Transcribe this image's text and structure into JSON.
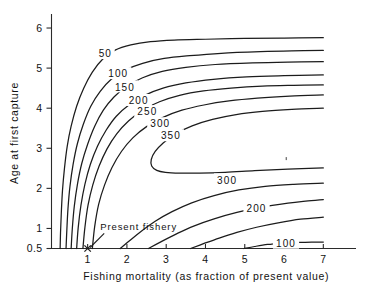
{
  "chart_data": {
    "type": "line",
    "subtype": "contour",
    "title": "",
    "xlabel": "Fishing mortality (as fraction of present value)",
    "ylabel": "Age at first capture",
    "xlim": [
      0.08,
      7.45
    ],
    "ylim": [
      0.5,
      6.25
    ],
    "grid": false,
    "legend": "none",
    "xticks": [
      1,
      2,
      3,
      4,
      5,
      6,
      7
    ],
    "xticklabels": [
      "1",
      "2",
      "3",
      "4",
      "5",
      "6",
      "7"
    ],
    "yticks": [
      0.5,
      1,
      2,
      3,
      4,
      5,
      6
    ],
    "yticklabels": [
      "0.5",
      "1",
      "2",
      "3",
      "4",
      "5",
      "6"
    ],
    "contour_levels": [
      50,
      100,
      150,
      200,
      250,
      300,
      350
    ],
    "zlabel": "Yield",
    "annotations": [
      {
        "text": "Present fishery",
        "x": 1.0,
        "y": 0.5,
        "label_x": 1.32,
        "label_y": 0.95,
        "marker": "x"
      }
    ],
    "contour_labels": [
      {
        "level": "50",
        "x": 1.45,
        "y": 5.35
      },
      {
        "level": "100",
        "x": 1.78,
        "y": 4.85
      },
      {
        "level": "150",
        "x": 1.95,
        "y": 4.52
      },
      {
        "level": "200",
        "x": 2.3,
        "y": 4.18
      },
      {
        "level": "250",
        "x": 2.52,
        "y": 3.9
      },
      {
        "level": "300",
        "x": 2.85,
        "y": 3.6
      },
      {
        "level": "350",
        "x": 3.12,
        "y": 3.3
      },
      {
        "level": "300",
        "x": 4.55,
        "y": 2.2
      },
      {
        "level": "200",
        "x": 5.3,
        "y": 1.5
      },
      {
        "level": "100",
        "x": 6.05,
        "y": 0.62
      }
    ],
    "contours": [
      {
        "level": 50,
        "branch": "upper",
        "points": [
          [
            0.3,
            0.5
          ],
          [
            0.31,
            0.9
          ],
          [
            0.33,
            1.4
          ],
          [
            0.36,
            1.95
          ],
          [
            0.41,
            2.5
          ],
          [
            0.48,
            3.05
          ],
          [
            0.58,
            3.55
          ],
          [
            0.72,
            4.05
          ],
          [
            0.9,
            4.5
          ],
          [
            1.12,
            4.9
          ],
          [
            1.38,
            5.22
          ],
          [
            1.7,
            5.45
          ],
          [
            2.1,
            5.58
          ],
          [
            2.6,
            5.66
          ],
          [
            3.2,
            5.7
          ],
          [
            4.0,
            5.72
          ],
          [
            5.0,
            5.74
          ],
          [
            6.0,
            5.75
          ],
          [
            7.0,
            5.76
          ]
        ]
      },
      {
        "level": 100,
        "branch": "upper",
        "points": [
          [
            0.45,
            0.5
          ],
          [
            0.47,
            0.95
          ],
          [
            0.5,
            1.5
          ],
          [
            0.55,
            2.05
          ],
          [
            0.63,
            2.6
          ],
          [
            0.74,
            3.12
          ],
          [
            0.89,
            3.6
          ],
          [
            1.08,
            4.05
          ],
          [
            1.32,
            4.42
          ],
          [
            1.6,
            4.72
          ],
          [
            1.95,
            4.95
          ],
          [
            2.4,
            5.12
          ],
          [
            2.95,
            5.24
          ],
          [
            3.6,
            5.31
          ],
          [
            4.4,
            5.37
          ],
          [
            5.4,
            5.41
          ],
          [
            6.2,
            5.43
          ],
          [
            7.0,
            5.44
          ]
        ]
      },
      {
        "level": 150,
        "branch": "upper",
        "points": [
          [
            0.58,
            0.5
          ],
          [
            0.61,
            1.0
          ],
          [
            0.66,
            1.55
          ],
          [
            0.74,
            2.1
          ],
          [
            0.85,
            2.62
          ],
          [
            1.0,
            3.1
          ],
          [
            1.18,
            3.55
          ],
          [
            1.4,
            3.95
          ],
          [
            1.67,
            4.28
          ],
          [
            2.0,
            4.55
          ],
          [
            2.4,
            4.76
          ],
          [
            2.9,
            4.92
          ],
          [
            3.5,
            5.02
          ],
          [
            4.25,
            5.09
          ],
          [
            5.2,
            5.13
          ],
          [
            6.1,
            5.15
          ],
          [
            7.0,
            5.16
          ]
        ]
      },
      {
        "level": 200,
        "branch": "upper",
        "points": [
          [
            0.72,
            0.5
          ],
          [
            0.76,
            1.02
          ],
          [
            0.83,
            1.58
          ],
          [
            0.93,
            2.1
          ],
          [
            1.07,
            2.6
          ],
          [
            1.25,
            3.05
          ],
          [
            1.47,
            3.45
          ],
          [
            1.73,
            3.8
          ],
          [
            2.05,
            4.08
          ],
          [
            2.45,
            4.32
          ],
          [
            2.92,
            4.5
          ],
          [
            3.5,
            4.63
          ],
          [
            4.2,
            4.72
          ],
          [
            5.05,
            4.78
          ],
          [
            6.0,
            4.81
          ],
          [
            7.0,
            4.83
          ]
        ]
      },
      {
        "level": 250,
        "branch": "upper",
        "points": [
          [
            0.88,
            0.5
          ],
          [
            0.93,
            1.02
          ],
          [
            1.01,
            1.58
          ],
          [
            1.13,
            2.08
          ],
          [
            1.29,
            2.55
          ],
          [
            1.49,
            2.98
          ],
          [
            1.74,
            3.36
          ],
          [
            2.04,
            3.68
          ],
          [
            2.4,
            3.95
          ],
          [
            2.83,
            4.16
          ],
          [
            3.34,
            4.32
          ],
          [
            3.95,
            4.43
          ],
          [
            4.65,
            4.5
          ],
          [
            5.45,
            4.55
          ],
          [
            6.25,
            4.57
          ],
          [
            7.0,
            4.58
          ]
        ]
      },
      {
        "level": 300,
        "branch": "upper",
        "points": [
          [
            1.12,
            0.5
          ],
          [
            1.18,
            1.05
          ],
          [
            1.28,
            1.6
          ],
          [
            1.43,
            2.08
          ],
          [
            1.62,
            2.52
          ],
          [
            1.86,
            2.92
          ],
          [
            2.15,
            3.26
          ],
          [
            2.5,
            3.54
          ],
          [
            2.92,
            3.77
          ],
          [
            3.4,
            3.95
          ],
          [
            3.96,
            4.08
          ],
          [
            4.6,
            4.18
          ],
          [
            5.32,
            4.25
          ],
          [
            6.15,
            4.3
          ],
          [
            7.0,
            4.33
          ]
        ]
      },
      {
        "level": 350,
        "branch": "closed",
        "points": [
          [
            7.0,
            4.0
          ],
          [
            6.2,
            3.97
          ],
          [
            5.45,
            3.92
          ],
          [
            4.78,
            3.84
          ],
          [
            4.18,
            3.72
          ],
          [
            3.66,
            3.56
          ],
          [
            3.24,
            3.36
          ],
          [
            2.93,
            3.14
          ],
          [
            2.72,
            2.92
          ],
          [
            2.62,
            2.72
          ],
          [
            2.63,
            2.56
          ],
          [
            2.76,
            2.45
          ],
          [
            2.98,
            2.4
          ],
          [
            3.35,
            2.38
          ],
          [
            3.85,
            2.38
          ],
          [
            4.5,
            2.4
          ],
          [
            5.25,
            2.44
          ],
          [
            6.1,
            2.48
          ],
          [
            7.0,
            2.51
          ]
        ]
      },
      {
        "level": 300,
        "branch": "lower",
        "points": [
          [
            1.83,
            0.5
          ],
          [
            2.05,
            0.68
          ],
          [
            2.35,
            0.92
          ],
          [
            2.72,
            1.18
          ],
          [
            3.15,
            1.42
          ],
          [
            3.65,
            1.64
          ],
          [
            4.22,
            1.82
          ],
          [
            4.85,
            1.96
          ],
          [
            5.52,
            2.05
          ],
          [
            6.25,
            2.1
          ],
          [
            7.0,
            2.13
          ]
        ]
      },
      {
        "level": 250,
        "branch": "lower",
        "points": [
          [
            2.55,
            0.5
          ],
          [
            2.85,
            0.66
          ],
          [
            3.25,
            0.86
          ],
          [
            3.7,
            1.06
          ],
          [
            4.22,
            1.24
          ],
          [
            4.8,
            1.4
          ],
          [
            5.42,
            1.53
          ],
          [
            6.1,
            1.63
          ],
          [
            6.55,
            1.68
          ],
          [
            7.0,
            1.72
          ]
        ]
      },
      {
        "level": 200,
        "branch": "lower",
        "points": [
          [
            3.62,
            0.5
          ],
          [
            3.95,
            0.62
          ],
          [
            4.35,
            0.76
          ],
          [
            4.8,
            0.9
          ],
          [
            5.3,
            1.03
          ],
          [
            5.85,
            1.14
          ],
          [
            6.42,
            1.23
          ],
          [
            7.0,
            1.28
          ]
        ]
      },
      {
        "level": 100,
        "branch": "lower",
        "points": [
          [
            4.98,
            0.5
          ],
          [
            5.25,
            0.55
          ],
          [
            5.58,
            0.6
          ],
          [
            5.95,
            0.63
          ],
          [
            6.35,
            0.65
          ],
          [
            6.7,
            0.66
          ],
          [
            7.0,
            0.66
          ]
        ]
      }
    ],
    "specks": [
      {
        "x": 6.04,
        "y": 2.78
      }
    ]
  }
}
